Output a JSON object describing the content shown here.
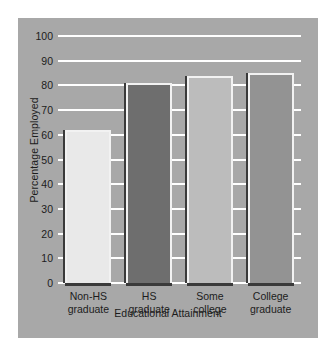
{
  "chart_data": {
    "type": "bar",
    "title": "",
    "xlabel": "Educational Attainment",
    "ylabel": "Percentage Employed",
    "categories": [
      "Non-HS graduate",
      "HS graduate",
      "Some college",
      "College graduate"
    ],
    "category_lines": [
      [
        "Non-HS",
        "graduate"
      ],
      [
        "HS",
        "graduate"
      ],
      [
        "Some",
        "college"
      ],
      [
        "College",
        "graduate"
      ]
    ],
    "values": [
      62,
      81,
      84,
      85
    ],
    "ylim": [
      0,
      100
    ],
    "ytick_step": 10,
    "yticks": [
      0,
      10,
      20,
      30,
      40,
      50,
      60,
      70,
      80,
      90,
      100
    ],
    "ytick_labels": [
      "0",
      "10",
      "20",
      "30",
      "40",
      "50",
      "60",
      "70",
      "80",
      "90",
      "100"
    ],
    "grid": true,
    "legend": false,
    "bar_colors": [
      "#e9e9e9",
      "#6e6e6e",
      "#bcbcbc",
      "#939393"
    ],
    "panel_color": "#a8a8a8",
    "gridline_color": "#ffffff",
    "bar_edge_color": "#f2f2f2",
    "bar_shadow_color": "#3a3a3a",
    "text_color": "#1c1c1c",
    "page_background": "#ffffff"
  }
}
